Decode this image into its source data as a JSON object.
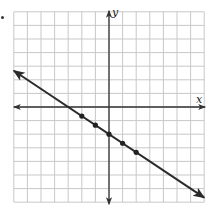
{
  "problem_marker": "•",
  "chart_data": {
    "type": "line",
    "title": "",
    "xlabel": "x",
    "ylabel": "y",
    "xlim": [
      -7,
      7
    ],
    "ylim": [
      -7,
      7
    ],
    "grid": true,
    "grid_step": 1,
    "tick_labels": false,
    "legend": null,
    "line": {
      "equation": "y = -2/3 x - 2",
      "slope": -0.6667,
      "intercept": -2,
      "x_start": -7,
      "x_end": 7,
      "arrows_both_ends": true
    },
    "points": [
      {
        "x": -2,
        "y": -0.667
      },
      {
        "x": -1,
        "y": -1.333
      },
      {
        "x": 0,
        "y": -2
      },
      {
        "x": 1,
        "y": -2.667
      },
      {
        "x": 2,
        "y": -3.333
      }
    ],
    "x_intercept": -3,
    "y_intercept": -2
  },
  "colors": {
    "grid": "#c8c8c8",
    "axis": "#333333",
    "line": "#2a2a2a",
    "points": "#222222",
    "background": "#ffffff"
  },
  "layout": {
    "origin_px": [
      109,
      107
    ],
    "unit_px": 13.6
  }
}
